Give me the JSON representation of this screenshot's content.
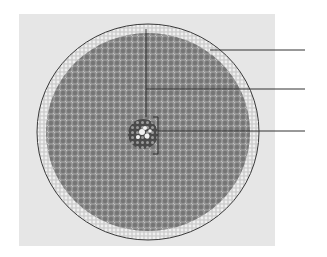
{
  "figure": {
    "colors": {
      "background": "#ffffff",
      "photo_background": "#e6e6e6",
      "tissue_dark": "#6f6f6f",
      "tissue_light": "#d8d8d8",
      "leader_line": "#333333"
    },
    "labels": [
      {
        "id": "label-1",
        "text": "",
        "points_to": "epidermis",
        "y": 50
      },
      {
        "id": "label-2",
        "text": "",
        "points_to": "cortex",
        "y": 89
      },
      {
        "id": "label-3",
        "text": "",
        "points_to": "vascular cylinder",
        "y": 131
      }
    ]
  }
}
